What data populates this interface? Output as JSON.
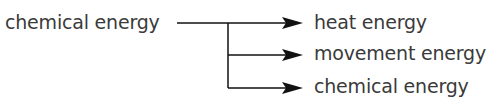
{
  "diagram": {
    "source": {
      "label": "chemical energy"
    },
    "outputs": [
      {
        "label": "heat energy"
      },
      {
        "label": "movement energy"
      },
      {
        "label": "chemical energy"
      }
    ],
    "colors": {
      "line": "#111111",
      "text": "#3a3a3a"
    }
  }
}
